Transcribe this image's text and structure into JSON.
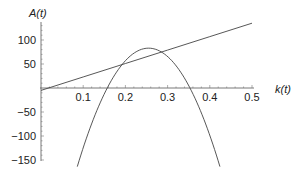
{
  "chart_data": {
    "type": "line",
    "title": "",
    "xlabel": "k(t)",
    "ylabel": "A(t)",
    "xlim": [
      0,
      0.5
    ],
    "ylim": [
      -150,
      135
    ],
    "grid": false,
    "legend": null,
    "x_ticks": [
      {
        "value": 0.1,
        "label": "0.1"
      },
      {
        "value": 0.2,
        "label": "0.2"
      },
      {
        "value": 0.3,
        "label": "0.3"
      },
      {
        "value": 0.4,
        "label": "0.4"
      },
      {
        "value": 0.5,
        "label": "0.5"
      }
    ],
    "y_ticks": [
      {
        "value": 100,
        "label": "100"
      },
      {
        "value": 50,
        "label": "50"
      },
      {
        "value": -50,
        "label": "−50"
      },
      {
        "value": -100,
        "label": "−100"
      },
      {
        "value": -150,
        "label": "−150"
      }
    ],
    "series": [
      {
        "name": "line",
        "kind": "linear",
        "x": [
          0,
          0.1,
          0.2,
          0.3,
          0.4,
          0.5
        ],
        "y": [
          -5,
          23,
          51,
          79,
          107,
          135
        ]
      },
      {
        "name": "parabola",
        "kind": "quadratic",
        "x": [
          0.086,
          0.1,
          0.125,
          0.15,
          0.157,
          0.175,
          0.2,
          0.225,
          0.255,
          0.275,
          0.3,
          0.325,
          0.35,
          0.353,
          0.375,
          0.4,
          0.424
        ],
        "y": [
          -154,
          -127,
          -63,
          -12,
          0,
          28,
          57,
          75,
          83,
          80,
          66,
          41,
          5,
          0,
          -41,
          -99,
          -154
        ]
      }
    ]
  }
}
